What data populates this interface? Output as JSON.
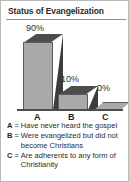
{
  "card": {
    "title": "Status of Evangelization"
  },
  "chart_data": {
    "type": "bar",
    "title": "Status of Evangelization",
    "categories": [
      "A",
      "B",
      "C"
    ],
    "values": [
      90,
      10,
      0
    ],
    "value_labels": [
      "90%",
      "10%",
      "0%"
    ],
    "xlabel": "",
    "ylabel": "",
    "ylim": [
      0,
      100
    ],
    "grid": false,
    "legend_position": "below",
    "style": "3d-bar",
    "colors": {
      "bar_front": "#a9a9a9",
      "bar_top": "#4d4d4d",
      "bar_side": "#3c3c3c",
      "outline": "#5d5d5d",
      "text": "#2b2b2b",
      "background": "#ffffff",
      "border": "#b9b9b9"
    },
    "legend": [
      {
        "key": "A",
        "eq": "=",
        "text": "Have never heard the gospel"
      },
      {
        "key": "B",
        "eq": "=",
        "text": "Were evangelized but did not become Christians"
      },
      {
        "key": "C",
        "eq": "=",
        "text": "Are adherents to any form of Christianity"
      }
    ]
  }
}
